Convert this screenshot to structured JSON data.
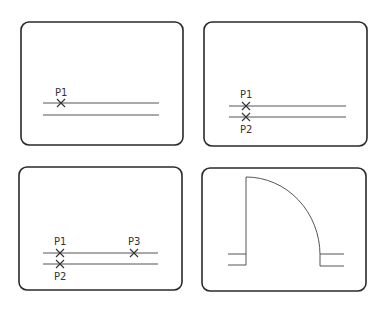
{
  "panels": [
    {
      "id": "panel-1",
      "frame": {
        "x": 21,
        "y": 22,
        "w": 162,
        "h": 123,
        "r": 8
      },
      "lines": [
        {
          "x1": 43,
          "y1": 103,
          "x2": 159,
          "y2": 103
        },
        {
          "x1": 43,
          "y1": 115,
          "x2": 159,
          "y2": 115
        }
      ],
      "points": [
        {
          "label": "P1",
          "x": 61,
          "y": 103,
          "label_x": 55,
          "label_y": 96
        }
      ]
    },
    {
      "id": "panel-2",
      "frame": {
        "x": 204,
        "y": 22,
        "w": 163,
        "h": 124,
        "r": 8
      },
      "lines": [
        {
          "x1": 229,
          "y1": 106,
          "x2": 346,
          "y2": 106
        },
        {
          "x1": 229,
          "y1": 117,
          "x2": 346,
          "y2": 117
        }
      ],
      "points": [
        {
          "label": "P1",
          "x": 246,
          "y": 106,
          "label_x": 240,
          "label_y": 98
        },
        {
          "label": "P2",
          "x": 246,
          "y": 117,
          "label_x": 240,
          "label_y": 133
        }
      ]
    },
    {
      "id": "panel-3",
      "frame": {
        "x": 19,
        "y": 167,
        "w": 163,
        "h": 123,
        "r": 8
      },
      "lines": [
        {
          "x1": 43,
          "y1": 253,
          "x2": 158,
          "y2": 253
        },
        {
          "x1": 43,
          "y1": 264,
          "x2": 158,
          "y2": 264
        }
      ],
      "points": [
        {
          "label": "P1",
          "x": 60,
          "y": 253,
          "label_x": 54,
          "label_y": 245
        },
        {
          "label": "P2",
          "x": 60,
          "y": 264,
          "label_x": 54,
          "label_y": 280
        },
        {
          "label": "P3",
          "x": 134,
          "y": 253,
          "label_x": 128,
          "label_y": 245
        }
      ]
    },
    {
      "id": "panel-4",
      "frame": {
        "x": 202,
        "y": 168,
        "w": 164,
        "h": 123,
        "r": 8
      },
      "shape": "door-swing",
      "door": {
        "hinge_x": 246,
        "top_y": 177,
        "bottom_y": 265,
        "arc_end_x": 320,
        "arc_end_y": 255,
        "right_bottom_y": 266
      },
      "wall_stubs": [
        {
          "x1": 228,
          "y1": 254,
          "x2": 246,
          "y2": 254
        },
        {
          "x1": 228,
          "y1": 265,
          "x2": 246,
          "y2": 265
        },
        {
          "x1": 320,
          "y1": 254,
          "x2": 344,
          "y2": 254
        },
        {
          "x1": 320,
          "y1": 266,
          "x2": 344,
          "y2": 266
        }
      ]
    }
  ],
  "colors": {
    "frame": "#2a2a2a",
    "line": "#555555",
    "background": "#ffffff"
  }
}
